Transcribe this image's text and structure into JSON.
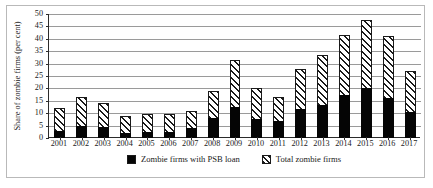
{
  "chart_data": {
    "type": "bar",
    "title": "",
    "subtitle": "",
    "xlabel": "",
    "ylabel": "Share of zombie firms (per cent)",
    "ylim": [
      0,
      50
    ],
    "yticks": [
      0,
      5,
      10,
      15,
      20,
      25,
      30,
      35,
      40,
      45,
      50
    ],
    "grid": true,
    "grid_axis": "y",
    "legend_position": "bottom-center",
    "stacking": "overlay",
    "categories": [
      "2001",
      "2002",
      "2003",
      "2004",
      "2005",
      "2006",
      "2007",
      "2008",
      "2009",
      "2010",
      "2011",
      "2012",
      "2013",
      "2014",
      "2015",
      "2016",
      "2017"
    ],
    "series": [
      {
        "name": "Total zombie firms",
        "style": "hatched",
        "color": "#1a1a1a",
        "values": [
          12.0,
          16.5,
          14.0,
          9.0,
          9.5,
          9.5,
          11.0,
          19.0,
          31.5,
          20.0,
          16.5,
          28.0,
          33.5,
          41.5,
          47.5,
          41.0,
          27.0
        ]
      },
      {
        "name": "Zombie firms with PSB loan",
        "style": "solid",
        "color": "#050505",
        "values": [
          3.0,
          5.0,
          4.5,
          2.0,
          2.5,
          2.5,
          4.0,
          8.0,
          12.5,
          7.5,
          7.0,
          11.5,
          13.5,
          17.5,
          20.0,
          16.0,
          10.5
        ]
      }
    ]
  },
  "axis": {
    "y_title": "Share of zombie firms (per cent)",
    "y_ticks": [
      "0",
      "5",
      "10",
      "15",
      "20",
      "25",
      "30",
      "35",
      "40",
      "45",
      "50"
    ],
    "x_ticks": [
      "2001",
      "2002",
      "2003",
      "2004",
      "2005",
      "2006",
      "2007",
      "2008",
      "2009",
      "2010",
      "2011",
      "2012",
      "2013",
      "2014",
      "2015",
      "2016",
      "2017"
    ]
  },
  "legend": {
    "items": [
      {
        "label": "Zombie firms with PSB loan",
        "swatch": "solid-black-square"
      },
      {
        "label": "Total zombie firms",
        "swatch": "hatched-square"
      }
    ]
  },
  "colors": {
    "solid_series": "#050505",
    "hatch_series": "#1a1a1a",
    "gridline": "#9a9a9a",
    "axis": "#2b2b2b",
    "frame": "#b9b9b9",
    "background": "#ffffff"
  }
}
